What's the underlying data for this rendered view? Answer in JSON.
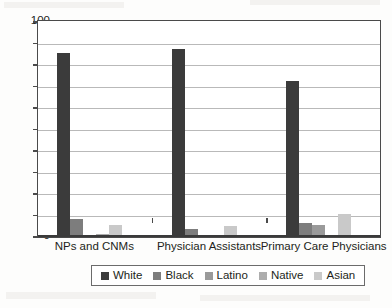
{
  "chart_data": {
    "type": "bar",
    "title": "",
    "subtitle": "",
    "xlabel": "",
    "ylabel": "",
    "ylim": [
      0,
      100
    ],
    "ytick_step": 10,
    "yticks": [
      0,
      10,
      20,
      30,
      40,
      50,
      60,
      70,
      80,
      90,
      100
    ],
    "grid": true,
    "legend_position": "bottom",
    "categories": [
      "NPs and CNMs",
      "Physician Assistants",
      "Primary Care Physicians"
    ],
    "series": [
      {
        "name": "White",
        "color": "#3b3b3b",
        "values": [
          85,
          86.5,
          72
        ]
      },
      {
        "name": "Black",
        "color": "#7d7d7d",
        "values": [
          7.5,
          3,
          6
        ]
      },
      {
        "name": "Latino",
        "color": "#9a9a9a",
        "values": [
          0.4,
          0.3,
          5
        ]
      },
      {
        "name": "Native",
        "color": "#adadad",
        "values": [
          0.8,
          0.3,
          0.3
        ]
      },
      {
        "name": "Asian",
        "color": "#c9c9c9",
        "values": [
          5,
          4.5,
          10
        ]
      }
    ]
  },
  "legend": {
    "items": [
      {
        "label": "White"
      },
      {
        "label": "Black"
      },
      {
        "label": "Latino"
      },
      {
        "label": "Native"
      },
      {
        "label": "Asian"
      }
    ]
  }
}
